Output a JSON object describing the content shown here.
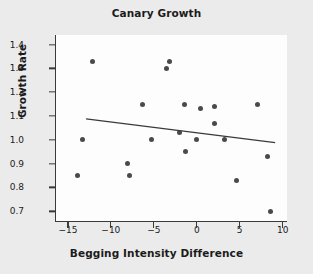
{
  "chart_data": {
    "type": "scatter",
    "title": "Canary Growth",
    "xlabel": "Begging Intensity Difference",
    "ylabel": "Growth Rate",
    "xlim": [
      -16.5,
      10.5
    ],
    "ylim": [
      0.655,
      1.44
    ],
    "grid": false,
    "legend": null,
    "xticks": [
      -15,
      -10,
      -5,
      0,
      5,
      10
    ],
    "xtick_labels": [
      "−15",
      "−10",
      "−5",
      "0",
      "5",
      "10"
    ],
    "yticks": [
      0.7,
      0.8,
      0.9,
      1.0,
      1.1,
      1.2,
      1.3,
      1.4
    ],
    "ytick_labels": [
      "0.7",
      "0.8",
      "0.9",
      "1.0",
      "1.1",
      "1.2",
      "1.3",
      "1.4"
    ],
    "marker_color": "#4a4a4a",
    "line_color": "#3a3a3a",
    "plot_background": "#fdfdfd",
    "figure_background": "#ebebeb",
    "points": [
      {
        "x": -14.0,
        "y": 0.85
      },
      {
        "x": -13.4,
        "y": 1.0
      },
      {
        "x": -12.3,
        "y": 1.33
      },
      {
        "x": -8.2,
        "y": 0.9
      },
      {
        "x": -8.0,
        "y": 0.85
      },
      {
        "x": -6.4,
        "y": 1.15
      },
      {
        "x": -5.4,
        "y": 1.0
      },
      {
        "x": -3.6,
        "y": 1.3
      },
      {
        "x": -3.3,
        "y": 1.33
      },
      {
        "x": -2.1,
        "y": 1.03
      },
      {
        "x": -1.5,
        "y": 1.15
      },
      {
        "x": -1.4,
        "y": 0.95
      },
      {
        "x": -0.1,
        "y": 1.0
      },
      {
        "x": 0.3,
        "y": 1.13
      },
      {
        "x": 1.9,
        "y": 1.07
      },
      {
        "x": 2.0,
        "y": 1.14
      },
      {
        "x": 3.1,
        "y": 1.0
      },
      {
        "x": 4.5,
        "y": 0.83
      },
      {
        "x": 6.9,
        "y": 1.15
      },
      {
        "x": 8.1,
        "y": 0.93
      },
      {
        "x": 8.5,
        "y": 0.7
      }
    ],
    "trend_line": {
      "x_start": -13.0,
      "y_start": 1.088,
      "x_end": 9.0,
      "y_end": 0.988
    }
  }
}
